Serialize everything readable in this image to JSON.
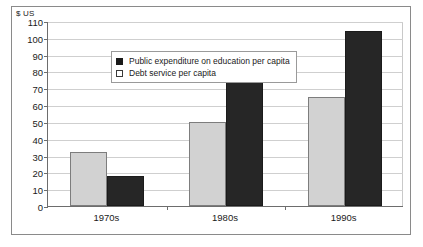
{
  "chart_data": {
    "type": "bar",
    "title": "",
    "xlabel": "",
    "ylabel": "$ US",
    "ylim": [
      0,
      110
    ],
    "ytick_step": 10,
    "yticks": [
      0,
      10,
      20,
      30,
      40,
      50,
      60,
      70,
      80,
      90,
      100,
      110
    ],
    "grid": true,
    "legend_position": "top-left inside plot",
    "categories": [
      "1970s",
      "1980s",
      "1990s"
    ],
    "series": [
      {
        "name": "Debt service per capita",
        "swatch": "hollow-square",
        "color": "#d2d2d2",
        "values": [
          32,
          50,
          65
        ]
      },
      {
        "name": "Public expenditure on education per capita",
        "swatch": "filled-square",
        "color": "#262626",
        "values": [
          18,
          79,
          104
        ]
      }
    ],
    "legend": [
      "Public expenditure on education per capita",
      "Debt service per capita"
    ]
  },
  "axis": {
    "unit_caption": "$ US",
    "y_tick_labels": [
      "110",
      "100",
      "90",
      "80",
      "70",
      "60",
      "50",
      "40",
      "30",
      "20",
      "10",
      "0"
    ],
    "x_tick_labels": [
      "1970s",
      "1980s",
      "1990s"
    ]
  },
  "legend": {
    "entries": [
      {
        "label": "Public expenditure on education per capita",
        "swatch": "filled"
      },
      {
        "label": "Debt service per capita",
        "swatch": "hollow"
      }
    ]
  },
  "colors": {
    "bar_light": "#d2d2d2",
    "bar_dark": "#262626",
    "gridline": "#cfcfcf",
    "axis": "#6d6d6d",
    "frame": "#8a8a8a",
    "text": "#1a1a1a"
  }
}
